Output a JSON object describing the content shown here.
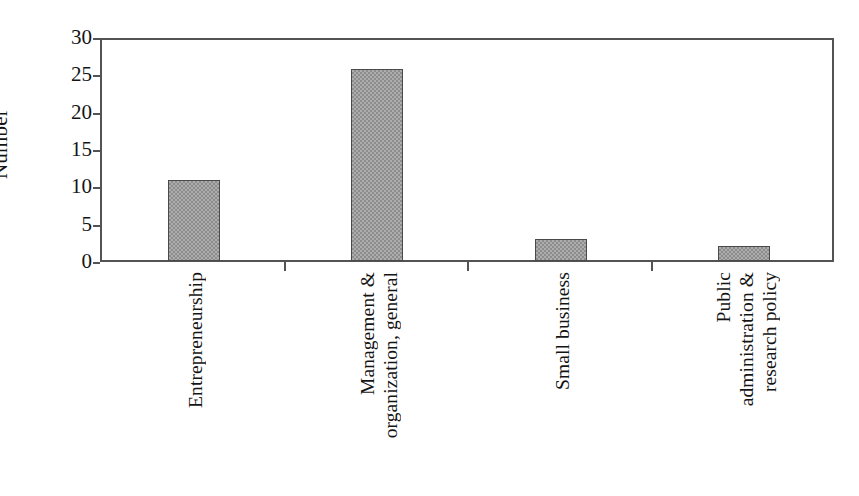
{
  "chart_data": {
    "type": "bar",
    "title": "",
    "subtitle": "",
    "xlabel": "",
    "ylabel": "Number",
    "ylim": [
      0,
      30
    ],
    "yticks": [
      0,
      5,
      10,
      15,
      20,
      25,
      30
    ],
    "ytick_labels": [
      "0",
      "5",
      "10",
      "15",
      "20",
      "25",
      "30"
    ],
    "grid": false,
    "legend": false,
    "legend_position": "none",
    "categories": [
      "Entrepreneurship",
      "Management & organization, general",
      "Small business",
      "Public administration & research policy"
    ],
    "category_label_lines": [
      [
        "Entrepreneurship"
      ],
      [
        "Management &",
        "organization, general"
      ],
      [
        "Small business"
      ],
      [
        "Public",
        "administration &",
        "research policy"
      ]
    ],
    "values": [
      11,
      26,
      3,
      2
    ],
    "bar_color": "#9a9a9a",
    "bar_edge_color": "#4a4a4a",
    "axis_color": "#535353",
    "background": "#ffffff"
  },
  "axis": {
    "y_title": "Number"
  }
}
